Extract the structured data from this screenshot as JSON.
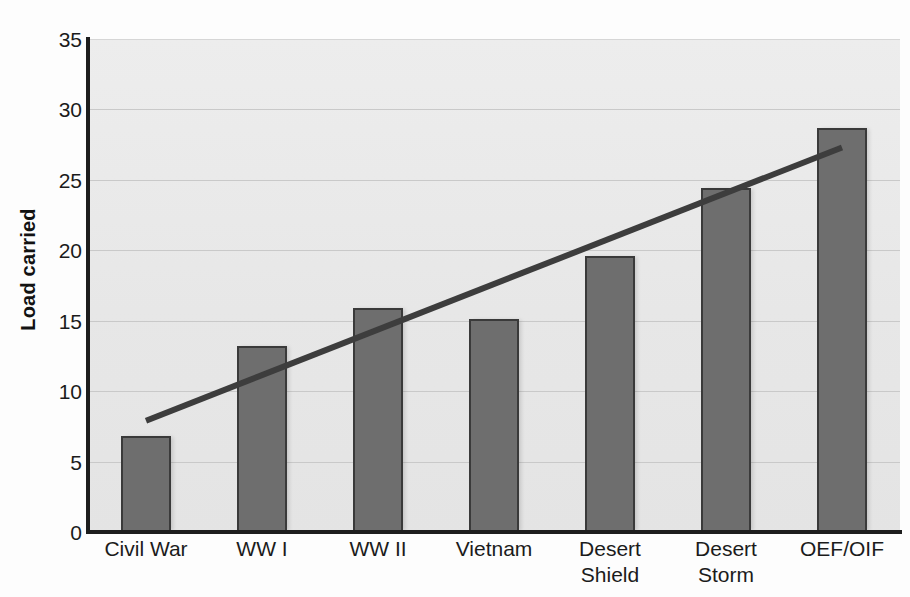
{
  "chart_data": {
    "type": "bar",
    "title": "",
    "subtitle": "",
    "xlabel": "",
    "ylabel": "Load carried",
    "categories": [
      "Civil War",
      "WW I",
      "WW II",
      "Vietnam",
      "Desert Shield",
      "Desert Storm",
      "OEF/OIF"
    ],
    "category_labels_wrapped": [
      "Civil War",
      "WW I",
      "WW II",
      "Vietnam",
      "Desert\nShield",
      "Desert\nStorm",
      "OEF/OIF"
    ],
    "values": [
      6.8,
      13.2,
      15.9,
      15.1,
      19.6,
      24.4,
      28.7
    ],
    "series": [
      {
        "name": "Load carried",
        "values": [
          6.8,
          13.2,
          15.9,
          15.1,
          19.6,
          24.4,
          28.7
        ]
      }
    ],
    "ylim": [
      0,
      35
    ],
    "xlim": [
      0,
      7
    ],
    "yticks": [
      0,
      5,
      10,
      15,
      20,
      25,
      30,
      35
    ],
    "ytick_labels": [
      "0",
      "5",
      "10",
      "15",
      "20",
      "25",
      "30",
      "35"
    ],
    "grid": true,
    "grid_axis": "y",
    "legend": false,
    "legend_position": "none",
    "trendline": {
      "type": "linear",
      "x_start_category_index": 0,
      "x_end_category_index": 6,
      "y_start": 7.9,
      "y_end": 27.3,
      "color": "#3d3d3d"
    },
    "annotations": [],
    "colors": {
      "bar_fill": "#6e6e6e",
      "bar_border": "#3a3a3a",
      "plot_background": "#eaeaea",
      "gridline": "#c9c9c9",
      "axis": "#1d1d1d",
      "text": "#1b1b1b",
      "trendline": "#3d3d3d"
    }
  }
}
